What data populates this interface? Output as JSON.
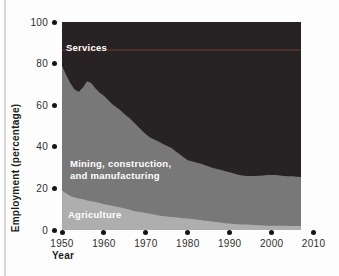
{
  "colors": {
    "background": "#fdfdfd",
    "page_edge": "#d6d6d6",
    "tick_dot": "#151515",
    "tick_text": "#2e2e2e",
    "axis_title_text": "#1d1d1d",
    "area_label_text": "#ffffff"
  },
  "chart_data": {
    "type": "area",
    "stacked": true,
    "title": "",
    "xlabel": "Year",
    "ylabel": "Employment (percentage)",
    "xlim": [
      1950,
      2010
    ],
    "ylim": [
      0,
      100
    ],
    "x_ticks": [
      1950,
      1960,
      1970,
      1980,
      1990,
      2000,
      2010
    ],
    "y_ticks": [
      0,
      20,
      40,
      60,
      80,
      100
    ],
    "grid": false,
    "legend_position": "labels-inside-areas",
    "data_end_year": 2007,
    "years": [
      1950,
      1951,
      1952,
      1953,
      1954,
      1955,
      1956,
      1957,
      1958,
      1959,
      1960,
      1961,
      1962,
      1963,
      1964,
      1965,
      1966,
      1967,
      1968,
      1969,
      1970,
      1971,
      1972,
      1973,
      1974,
      1975,
      1976,
      1977,
      1978,
      1979,
      1980,
      1981,
      1982,
      1983,
      1984,
      1985,
      1986,
      1987,
      1988,
      1989,
      1990,
      1991,
      1992,
      1993,
      1994,
      1995,
      1996,
      1997,
      1998,
      1999,
      2000,
      2001,
      2002,
      2003,
      2004,
      2005,
      2006,
      2007
    ],
    "series": [
      {
        "name": "Agriculture",
        "color": "#aeaeae",
        "values": [
          19.0,
          17.5,
          16.3,
          15.6,
          15.2,
          14.8,
          14.2,
          13.8,
          13.5,
          13.0,
          12.4,
          12.0,
          11.6,
          11.2,
          10.8,
          10.3,
          9.8,
          9.3,
          8.8,
          8.5,
          8.2,
          7.8,
          7.4,
          7.0,
          6.7,
          6.5,
          6.3,
          6.1,
          5.9,
          5.7,
          5.5,
          5.3,
          5.1,
          4.8,
          4.5,
          4.3,
          4.0,
          3.8,
          3.5,
          3.3,
          3.1,
          2.9,
          2.8,
          2.7,
          2.6,
          2.5,
          2.4,
          2.3,
          2.2,
          2.1,
          2.1,
          2.0,
          2.0,
          2.0,
          1.9,
          1.9,
          1.9,
          1.9
        ]
      },
      {
        "name": "Mining, construction, and manufacturing",
        "color": "#787878",
        "values": [
          60.0,
          57.0,
          54.2,
          51.9,
          51.3,
          53.7,
          57.3,
          56.7,
          54.5,
          53.0,
          52.1,
          50.5,
          48.9,
          47.8,
          46.7,
          45.2,
          44.2,
          42.7,
          41.2,
          39.5,
          37.8,
          36.7,
          36.1,
          35.5,
          34.8,
          34.0,
          33.2,
          31.9,
          30.6,
          29.3,
          28.0,
          27.7,
          27.4,
          27.2,
          26.8,
          26.2,
          25.8,
          25.5,
          25.3,
          25.0,
          24.7,
          24.3,
          23.8,
          23.5,
          23.4,
          23.5,
          23.6,
          23.8,
          24.0,
          24.3,
          24.4,
          24.4,
          24.2,
          24.0,
          24.0,
          23.9,
          23.7,
          23.6
        ]
      },
      {
        "name": "Services",
        "color": "#272223",
        "values": [
          21.0,
          25.5,
          29.5,
          32.5,
          33.5,
          31.5,
          28.5,
          29.5,
          32.0,
          34.0,
          35.5,
          37.5,
          39.5,
          41.0,
          42.5,
          44.5,
          46.0,
          48.0,
          50.0,
          52.0,
          54.0,
          55.5,
          56.5,
          57.5,
          58.5,
          59.5,
          60.5,
          62.0,
          63.5,
          65.0,
          66.5,
          67.0,
          67.5,
          68.0,
          68.7,
          69.5,
          70.2,
          70.7,
          71.2,
          71.7,
          72.2,
          72.8,
          73.4,
          73.8,
          74.0,
          74.0,
          74.0,
          73.9,
          73.8,
          73.6,
          73.5,
          73.6,
          73.8,
          74.0,
          74.1,
          74.2,
          74.4,
          74.5
        ]
      }
    ],
    "area_labels": {
      "services": "Services",
      "mining_line1": "Mining, construction,",
      "mining_line2": "and manufacturing",
      "agriculture": "Agriculture"
    },
    "artifact_line": {
      "y_percent": 87,
      "color": "rgba(150,70,55,0.35)"
    }
  },
  "axes": {
    "y_tick_labels": [
      "100",
      "80",
      "60",
      "40",
      "20",
      "0"
    ],
    "x_tick_labels": [
      "1950",
      "1960",
      "1970",
      "1980",
      "1990",
      "2000",
      "2010"
    ]
  }
}
